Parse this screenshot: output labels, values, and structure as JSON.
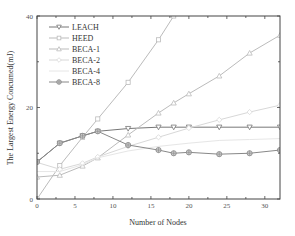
{
  "chart_data": {
    "type": "line",
    "title": "",
    "xlabel": "Number of Nodes",
    "ylabel": "The Largest Energy Concumed(mJ)",
    "xlim": [
      0,
      32
    ],
    "ylim": [
      0,
      40
    ],
    "x_ticks": [
      0,
      5,
      10,
      15,
      20,
      25,
      30
    ],
    "y_ticks": [
      0,
      20,
      40
    ],
    "grid": false,
    "legend_position": "upper left",
    "series": [
      {
        "name": "LEACH",
        "marker": "triangle-down",
        "color": "#777777",
        "x": [
          0,
          3,
          6,
          8,
          12,
          16,
          18,
          20,
          24,
          28,
          32
        ],
        "y": [
          8.1,
          12.2,
          13.8,
          14.8,
          15.4,
          15.7,
          15.7,
          15.7,
          15.7,
          15.7,
          15.7
        ]
      },
      {
        "name": "HEED",
        "marker": "square",
        "color": "#bbbbbb",
        "x": [
          0,
          3,
          6,
          8,
          12,
          16,
          18
        ],
        "y": [
          0,
          7.3,
          13.5,
          17.5,
          25.5,
          34.8,
          40
        ]
      },
      {
        "name": "BECA-1",
        "marker": "triangle-up",
        "color": "#bbbbbb",
        "x": [
          0,
          3,
          6,
          8,
          12,
          16,
          18,
          20,
          24,
          28,
          32
        ],
        "y": [
          4.8,
          5.2,
          7.2,
          9.0,
          14.0,
          18.8,
          21.0,
          23.0,
          26.9,
          31.9,
          35.8
        ]
      },
      {
        "name": "BECA-2",
        "marker": "diamond",
        "color": "#d8d8d8",
        "x": [
          0,
          3,
          6,
          8,
          12,
          16,
          20,
          24,
          28,
          32
        ],
        "y": [
          8.0,
          6.5,
          7.8,
          9.2,
          11.5,
          13.5,
          15.5,
          17.3,
          19.0,
          20.5
        ]
      },
      {
        "name": "BECA-4",
        "marker": "none",
        "color": "#e6e6e6",
        "x": [
          0,
          3,
          6,
          8,
          12,
          16,
          20,
          24,
          28,
          32
        ],
        "y": [
          6.0,
          6.0,
          7.5,
          9.0,
          10.5,
          11.5,
          12.2,
          12.8,
          13.0,
          13.2
        ]
      },
      {
        "name": "BECA-8",
        "marker": "circle-plus",
        "color": "#888888",
        "x": [
          0,
          3,
          6,
          8,
          12,
          16,
          18,
          20,
          24,
          28,
          32
        ],
        "y": [
          8.1,
          12.2,
          13.8,
          14.8,
          11.8,
          10.7,
          10.0,
          10.2,
          9.8,
          10.0,
          10.7
        ]
      }
    ]
  }
}
